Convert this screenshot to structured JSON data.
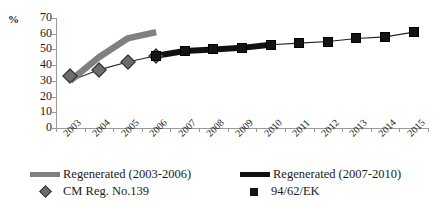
{
  "chart_data": {
    "type": "line",
    "title": "",
    "xlabel": "",
    "ylabel": "%",
    "ylim": [
      0,
      70
    ],
    "ytick_step": 10,
    "grid": false,
    "legend_position": "bottom",
    "categories": [
      "2003",
      "2004",
      "2005",
      "2006",
      "2007",
      "2008",
      "2009",
      "2010",
      "2011",
      "2012",
      "2013",
      "2014",
      "2015"
    ],
    "ytick_labels": [
      "70",
      "60",
      "50",
      "40",
      "30",
      "20",
      "10",
      "0"
    ],
    "series": [
      {
        "name": "Regenerated (2003-2006)",
        "style": "thick-line",
        "color": "#808080",
        "x": [
          "2003",
          "2004",
          "2005",
          "2006"
        ],
        "values": [
          30,
          45,
          57,
          61
        ]
      },
      {
        "name": "Regenerated (2007-2010)",
        "style": "thick-line",
        "color": "#111111",
        "x": [
          "2006",
          "2007",
          "2008",
          "2009",
          "2010"
        ],
        "values": [
          46,
          49,
          50,
          51,
          53
        ]
      },
      {
        "name": "CM Reg. No.139",
        "style": "diamond-markers",
        "color": "#6d6d6d",
        "x": [
          "2003",
          "2004",
          "2005",
          "2006"
        ],
        "values": [
          33,
          37,
          42,
          46
        ]
      },
      {
        "name": "94/62/EK",
        "style": "square-markers",
        "color": "#141414",
        "x": [
          "2006",
          "2007",
          "2008",
          "2009",
          "2010",
          "2011",
          "2012",
          "2013",
          "2014",
          "2015"
        ],
        "values": [
          46,
          49,
          50,
          51,
          53,
          54,
          55,
          57,
          58,
          61
        ]
      },
      {
        "name": "trend",
        "style": "thin-line",
        "color": "#222222",
        "x": [
          "2003",
          "2004",
          "2005",
          "2006",
          "2007",
          "2008",
          "2009",
          "2010",
          "2011",
          "2012",
          "2013",
          "2014",
          "2015"
        ],
        "values": [
          30,
          37,
          42,
          46,
          49,
          50,
          51,
          53,
          54,
          55,
          57,
          58,
          61
        ]
      }
    ]
  },
  "legend": {
    "items": [
      {
        "label": "Regenerated (2003-2006)",
        "marker": "gray-thick-line"
      },
      {
        "label": "Regenerated (2007-2010)",
        "marker": "black-thick-line"
      },
      {
        "label": "CM Reg. No.139",
        "marker": "gray-diamond"
      },
      {
        "label": "94/62/EK",
        "marker": "black-square"
      }
    ]
  },
  "axis": {
    "y_unit_label": "%"
  }
}
